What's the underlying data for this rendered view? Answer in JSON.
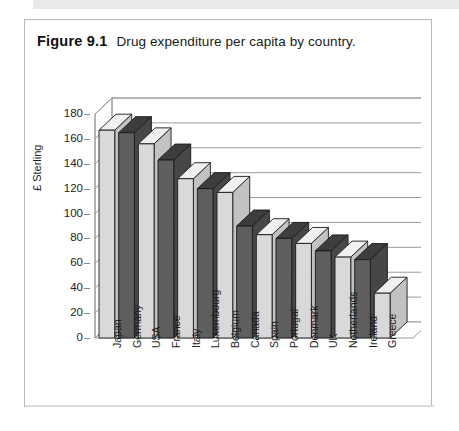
{
  "caption": {
    "figure_label": "Figure 9.1",
    "figure_text": "Drug expenditure per capita by country."
  },
  "colors": {
    "bar_light_front": "#d9d9d9",
    "bar_light_top": "#f0f0f0",
    "bar_light_side": "#c2c2c2",
    "bar_dark_front": "#5e5e5e",
    "bar_dark_top": "#3d3d3d",
    "bar_dark_side": "#474747",
    "outline": "#1a1a1a",
    "gridline": "#9a9a9a",
    "frame_border": "#b9b9b9",
    "page_band": "#e9e9e9"
  },
  "chart_data": {
    "type": "bar",
    "title": "Drug expenditure per capita by country.",
    "xlabel": "",
    "ylabel": "£ Sterling",
    "ylim": [
      0,
      180
    ],
    "ytick_step": 20,
    "yticks": [
      180,
      160,
      140,
      120,
      100,
      80,
      60,
      40,
      20,
      0
    ],
    "grid": true,
    "grid_axis": "y",
    "legend": false,
    "three_d": true,
    "categories": [
      "Japan",
      "Germany",
      "USA",
      "France",
      "Italy",
      "Luxembourg",
      "Belgium",
      "Canada",
      "Spain",
      "Portugal",
      "Denmark",
      "UK",
      "Netherlands",
      "Ireland",
      "Greece"
    ],
    "values": [
      167,
      165,
      156,
      143,
      128,
      120,
      117,
      90,
      83,
      80,
      76,
      70,
      65,
      63,
      36
    ],
    "bar_shades": [
      "light",
      "dark",
      "light",
      "dark",
      "light",
      "dark",
      "light",
      "dark",
      "light",
      "dark",
      "light",
      "dark",
      "light",
      "dark",
      "light"
    ]
  }
}
